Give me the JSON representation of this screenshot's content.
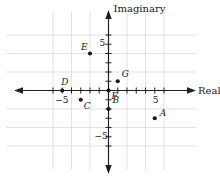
{
  "chart_data": {
    "type": "scatter",
    "title": "",
    "xlabel": "Real",
    "ylabel": "Imaginary",
    "xlim": [
      -7,
      7
    ],
    "ylim": [
      -6,
      6
    ],
    "grid": true,
    "grid_step": 2,
    "tick_step": 1,
    "legend": "none",
    "xticklabels": [
      {
        "value": -5,
        "text": "−5"
      },
      {
        "value": 5,
        "text": "5"
      }
    ],
    "yticklabels": [
      {
        "value": 5,
        "text": "5"
      },
      {
        "value": -5,
        "text": "−5"
      }
    ],
    "points": [
      {
        "label": "A",
        "x": 5,
        "y": -3,
        "label_dx": 5,
        "label_dy": -9
      },
      {
        "label": "B",
        "x": 0,
        "y": -2,
        "label_dx": 4,
        "label_dy": -13
      },
      {
        "label": "C",
        "x": -3,
        "y": -1,
        "label_dx": 3,
        "label_dy": 2
      },
      {
        "label": "D",
        "x": -5,
        "y": 0,
        "label_dx": -1,
        "label_dy": -13
      },
      {
        "label": "E",
        "x": -2,
        "y": 4,
        "label_dx": -9,
        "label_dy": -11
      },
      {
        "label": "F",
        "x": 0,
        "y": 0,
        "label_dx": 3,
        "label_dy": 1
      },
      {
        "label": "G",
        "x": 1,
        "y": 1,
        "label_dx": 4,
        "label_dy": -11
      }
    ]
  },
  "axes": {
    "real_label": "Real",
    "imaginary_label": "Imaginary"
  },
  "colors": {
    "axis": "#231f20",
    "grid": "#d9d9e3",
    "point": "#1a1a1a",
    "text": "#1a1a1a",
    "background": "#ffffff"
  }
}
